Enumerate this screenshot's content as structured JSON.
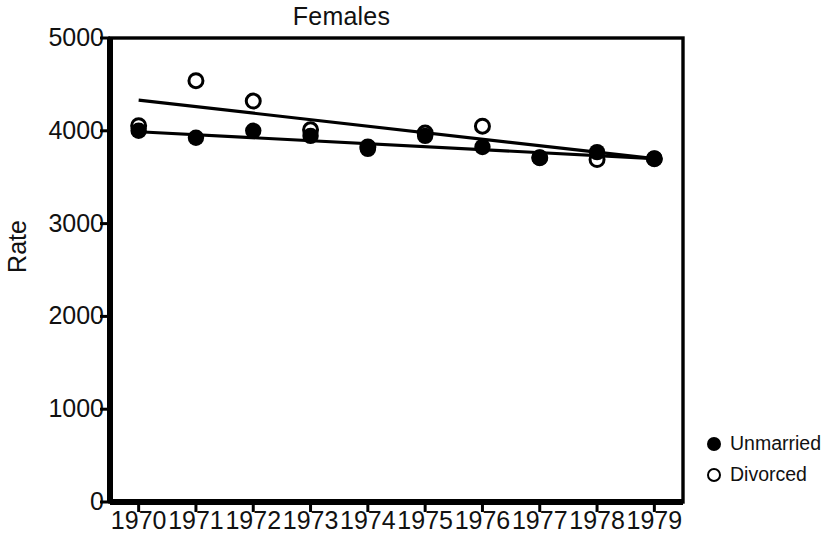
{
  "chart_data": {
    "type": "scatter",
    "title": "Females",
    "xlabel": "",
    "ylabel": "Rate",
    "x": [
      1970,
      1971,
      1972,
      1973,
      1974,
      1975,
      1976,
      1977,
      1978,
      1979
    ],
    "xticklabels": [
      "1970",
      "1971",
      "1972",
      "1973",
      "1974",
      "1975",
      "1976",
      "1977",
      "1978",
      "1979"
    ],
    "yticks": [
      0,
      1000,
      2000,
      3000,
      4000,
      5000
    ],
    "yticklabels": [
      "0",
      "1000",
      "2000",
      "3000",
      "4000",
      "5000"
    ],
    "xlim": [
      1969.5,
      1979.5
    ],
    "ylim": [
      0,
      5000
    ],
    "grid": false,
    "legend_position": "right-outside",
    "series": [
      {
        "name": "Unmarried",
        "marker": "filled-circle",
        "color": "#000000",
        "values": [
          4000,
          3925,
          4000,
          3945,
          3805,
          3945,
          3825,
          3710,
          3770,
          3700
        ],
        "trendline": {
          "start": 3990,
          "end": 3700
        }
      },
      {
        "name": "Divorced",
        "marker": "open-circle",
        "color": "#000000",
        "values": [
          4055,
          4540,
          4320,
          4010,
          3825,
          3975,
          4050,
          3710,
          3690,
          3700
        ],
        "trendline": {
          "start": 4330,
          "end": 3700
        }
      }
    ]
  },
  "legend": {
    "items": [
      {
        "label": "Unmarried",
        "marker": "filled-circle"
      },
      {
        "label": "Divorced",
        "marker": "open-circle"
      }
    ]
  },
  "colors": {
    "ink": "#000000",
    "background": "#ffffff"
  }
}
